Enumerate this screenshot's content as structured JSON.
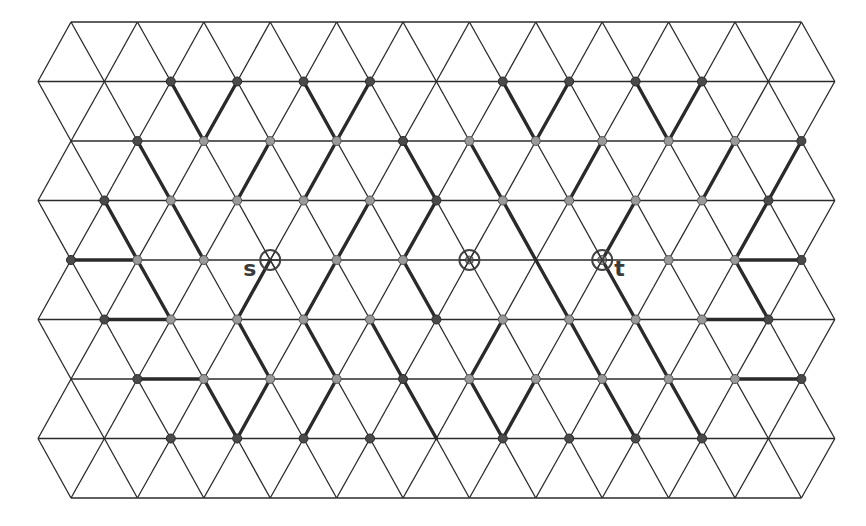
{
  "diagram": {
    "type": "triangular-lattice",
    "geometry": {
      "spacing": 66.4,
      "row_y": [
        22,
        81.5,
        141,
        200.5,
        260,
        319.5,
        379,
        438.5,
        498
      ],
      "even_row_x0": 71,
      "odd_row_x0": 38,
      "even_row_count": 12,
      "odd_row_count": 13
    },
    "colors": {
      "line": "#2b2b2b",
      "dot_dark": "#4a4a4a",
      "dot_light": "#9a9a9a",
      "label": "#3a3a3a"
    },
    "dots": {
      "dark": [
        [
          1,
          2
        ],
        [
          1,
          3
        ],
        [
          1,
          4
        ],
        [
          1,
          5
        ],
        [
          1,
          7
        ],
        [
          1,
          8
        ],
        [
          1,
          9
        ],
        [
          1,
          10
        ],
        [
          2,
          1
        ],
        [
          2,
          5
        ],
        [
          2,
          11
        ],
        [
          3,
          1
        ],
        [
          3,
          6
        ],
        [
          3,
          11
        ],
        [
          4,
          0
        ],
        [
          4,
          11
        ],
        [
          5,
          1
        ],
        [
          5,
          6
        ],
        [
          5,
          11
        ],
        [
          6,
          1
        ],
        [
          6,
          5
        ],
        [
          6,
          11
        ],
        [
          7,
          2
        ],
        [
          7,
          3
        ],
        [
          7,
          4
        ],
        [
          7,
          5
        ],
        [
          7,
          7
        ],
        [
          7,
          8
        ],
        [
          7,
          9
        ],
        [
          7,
          10
        ]
      ],
      "light": [
        [
          2,
          2
        ],
        [
          2,
          3
        ],
        [
          2,
          4
        ],
        [
          2,
          6
        ],
        [
          2,
          7
        ],
        [
          2,
          8
        ],
        [
          2,
          9
        ],
        [
          2,
          10
        ],
        [
          3,
          2
        ],
        [
          3,
          3
        ],
        [
          3,
          4
        ],
        [
          3,
          5
        ],
        [
          3,
          7
        ],
        [
          3,
          8
        ],
        [
          3,
          9
        ],
        [
          3,
          10
        ],
        [
          4,
          1
        ],
        [
          4,
          2
        ],
        [
          4,
          4
        ],
        [
          4,
          5
        ],
        [
          4,
          8
        ],
        [
          4,
          9
        ],
        [
          4,
          10
        ],
        [
          5,
          2
        ],
        [
          5,
          3
        ],
        [
          5,
          4
        ],
        [
          5,
          5
        ],
        [
          5,
          7
        ],
        [
          5,
          8
        ],
        [
          5,
          9
        ],
        [
          5,
          10
        ],
        [
          6,
          2
        ],
        [
          6,
          3
        ],
        [
          6,
          4
        ],
        [
          6,
          6
        ],
        [
          6,
          7
        ],
        [
          6,
          8
        ],
        [
          6,
          9
        ],
        [
          6,
          10
        ]
      ]
    },
    "thick_edges": [
      [
        [
          1,
          2
        ],
        [
          2,
          2
        ]
      ],
      [
        [
          1,
          3
        ],
        [
          2,
          2
        ]
      ],
      [
        [
          1,
          4
        ],
        [
          2,
          4
        ]
      ],
      [
        [
          1,
          5
        ],
        [
          2,
          4
        ]
      ],
      [
        [
          1,
          7
        ],
        [
          2,
          7
        ]
      ],
      [
        [
          1,
          8
        ],
        [
          2,
          7
        ]
      ],
      [
        [
          1,
          9
        ],
        [
          2,
          9
        ]
      ],
      [
        [
          1,
          10
        ],
        [
          2,
          9
        ]
      ],
      [
        [
          2,
          1
        ],
        [
          3,
          2
        ]
      ],
      [
        [
          2,
          3
        ],
        [
          3,
          3
        ]
      ],
      [
        [
          2,
          4
        ],
        [
          3,
          4
        ]
      ],
      [
        [
          2,
          5
        ],
        [
          3,
          6
        ]
      ],
      [
        [
          2,
          6
        ],
        [
          3,
          7
        ]
      ],
      [
        [
          2,
          8
        ],
        [
          3,
          8
        ]
      ],
      [
        [
          2,
          11
        ],
        [
          3,
          11
        ]
      ],
      [
        [
          2,
          10
        ],
        [
          3,
          10
        ]
      ],
      [
        [
          3,
          1
        ],
        [
          4,
          1
        ]
      ],
      [
        [
          3,
          2
        ],
        [
          4,
          2
        ]
      ],
      [
        [
          3,
          6
        ],
        [
          4,
          5
        ]
      ],
      [
        [
          3,
          5
        ],
        [
          4,
          4
        ]
      ],
      [
        [
          3,
          7
        ],
        [
          4,
          7
        ]
      ],
      [
        [
          3,
          9
        ],
        [
          4,
          8
        ]
      ],
      [
        [
          3,
          11
        ],
        [
          4,
          10
        ]
      ],
      [
        [
          4,
          0
        ],
        [
          4,
          1
        ]
      ],
      [
        [
          4,
          10
        ],
        [
          4,
          11
        ]
      ],
      [
        [
          4,
          1
        ],
        [
          5,
          2
        ]
      ],
      [
        [
          4,
          4
        ],
        [
          5,
          4
        ]
      ],
      [
        [
          4,
          5
        ],
        [
          5,
          6
        ]
      ],
      [
        [
          4,
          3
        ],
        [
          5,
          3
        ]
      ],
      [
        [
          4,
          7
        ],
        [
          5,
          8
        ]
      ],
      [
        [
          4,
          8
        ],
        [
          5,
          9
        ]
      ],
      [
        [
          4,
          10
        ],
        [
          5,
          11
        ]
      ],
      [
        [
          5,
          1
        ],
        [
          5,
          2
        ]
      ],
      [
        [
          5,
          10
        ],
        [
          5,
          11
        ]
      ],
      [
        [
          5,
          3
        ],
        [
          6,
          3
        ]
      ],
      [
        [
          5,
          4
        ],
        [
          6,
          4
        ]
      ],
      [
        [
          5,
          5
        ],
        [
          6,
          5
        ]
      ],
      [
        [
          5,
          7
        ],
        [
          6,
          6
        ]
      ],
      [
        [
          5,
          8
        ],
        [
          6,
          8
        ]
      ],
      [
        [
          5,
          9
        ],
        [
          6,
          9
        ]
      ],
      [
        [
          6,
          1
        ],
        [
          6,
          2
        ]
      ],
      [
        [
          6,
          10
        ],
        [
          6,
          11
        ]
      ],
      [
        [
          6,
          3
        ],
        [
          7,
          3
        ]
      ],
      [
        [
          6,
          2
        ],
        [
          7,
          3
        ]
      ],
      [
        [
          6,
          4
        ],
        [
          7,
          4
        ]
      ],
      [
        [
          6,
          5
        ],
        [
          7,
          6
        ]
      ],
      [
        [
          6,
          6
        ],
        [
          7,
          7
        ]
      ],
      [
        [
          6,
          7
        ],
        [
          7,
          7
        ]
      ],
      [
        [
          6,
          8
        ],
        [
          7,
          9
        ]
      ],
      [
        [
          6,
          9
        ],
        [
          7,
          10
        ]
      ]
    ],
    "markers": [
      {
        "name": "s",
        "row": 4,
        "col": 3,
        "label": "s",
        "label_side": "left"
      },
      {
        "name": "center",
        "row": 4,
        "col": 6,
        "label": "",
        "label_side": "none"
      },
      {
        "name": "t",
        "row": 4,
        "col": 8,
        "label": "t",
        "label_side": "right"
      }
    ],
    "labels": {
      "s": "s",
      "t": "t"
    }
  }
}
